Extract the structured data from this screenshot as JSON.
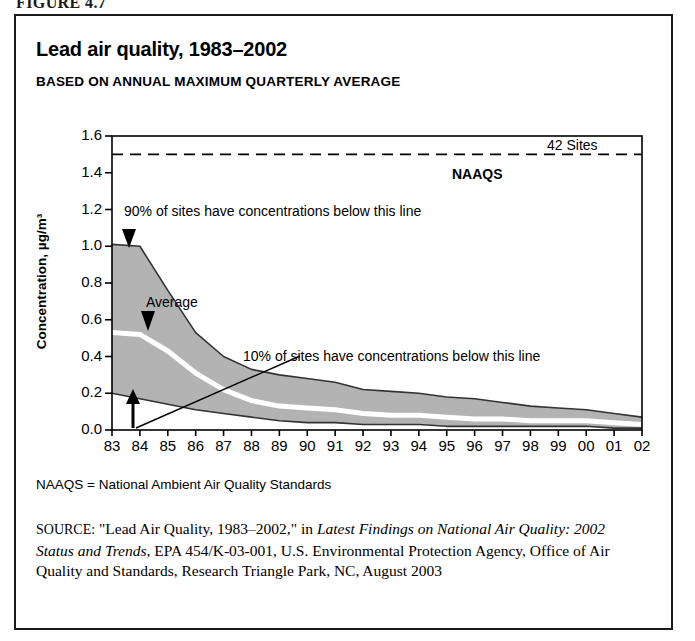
{
  "figure_label": "FIGURE 4.7",
  "title": "Lead air quality, 1983–2002",
  "subtitle": "BASED ON ANNUAL MAXIMUM QUARTERLY AVERAGE",
  "footnote": "NAAQS = National Ambient Air Quality Standards",
  "source": {
    "prefix": "SOURCE:",
    "quoted": "\"Lead Air Quality, 1983–2002,\"",
    "connector": "in",
    "italic_title": "Latest Findings on National Air Quality: 2002 Status and Trends,",
    "rest": "EPA 454/K-03-001, U.S. Environmental Protection Agency, Office of Air Quality and Standards, Research Triangle Park, NC, August 2003"
  },
  "colors": {
    "band_fill": "#b3b3b3",
    "band_line": "#333333",
    "average_line": "#ffffff",
    "axis": "#000000",
    "naaqs_line": "#000000"
  },
  "chart_data": {
    "type": "area",
    "title": "Lead air quality, 1983–2002",
    "subtitle": "BASED ON ANNUAL MAXIMUM QUARTERLY AVERAGE",
    "xlabel": "",
    "ylabel": "Concentration, µg/m³",
    "ylim": [
      0.0,
      1.6
    ],
    "ytick_labels": [
      "0.0",
      "0.2",
      "0.4",
      "0.6",
      "0.8",
      "1.0",
      "1.2",
      "1.4",
      "1.6"
    ],
    "ytick_values": [
      0.0,
      0.2,
      0.4,
      0.6,
      0.8,
      1.0,
      1.2,
      1.4,
      1.6
    ],
    "grid": false,
    "legend": "none",
    "x": [
      "83",
      "84",
      "85",
      "86",
      "87",
      "88",
      "89",
      "90",
      "91",
      "92",
      "93",
      "94",
      "95",
      "96",
      "97",
      "98",
      "99",
      "00",
      "01",
      "02"
    ],
    "x_full_years": [
      1983,
      1984,
      1985,
      1986,
      1987,
      1988,
      1989,
      1990,
      1991,
      1992,
      1993,
      1994,
      1995,
      1996,
      1997,
      1998,
      1999,
      2000,
      2001,
      2002
    ],
    "series": [
      {
        "name": "90% of sites have concentrations below this line",
        "role": "upper_band",
        "values": [
          1.01,
          1.0,
          0.76,
          0.53,
          0.4,
          0.33,
          0.3,
          0.28,
          0.26,
          0.22,
          0.21,
          0.2,
          0.18,
          0.17,
          0.15,
          0.13,
          0.12,
          0.11,
          0.09,
          0.07
        ]
      },
      {
        "name": "Average",
        "role": "mean_line",
        "values": [
          0.53,
          0.52,
          0.43,
          0.31,
          0.22,
          0.16,
          0.13,
          0.12,
          0.11,
          0.09,
          0.08,
          0.08,
          0.07,
          0.06,
          0.06,
          0.05,
          0.05,
          0.05,
          0.04,
          0.03
        ]
      },
      {
        "name": "10% of sites have concentrations below this line",
        "role": "lower_band",
        "values": [
          0.2,
          0.17,
          0.14,
          0.11,
          0.09,
          0.07,
          0.05,
          0.04,
          0.04,
          0.03,
          0.03,
          0.03,
          0.02,
          0.02,
          0.02,
          0.02,
          0.02,
          0.02,
          0.01,
          0.01
        ]
      }
    ],
    "reference_line": {
      "label": "NAAQS",
      "value": 1.5,
      "style": "dashed"
    },
    "annotations": [
      {
        "id": "sites-count",
        "text": "42 Sites"
      },
      {
        "id": "naaqs",
        "text": "NAAQS"
      },
      {
        "id": "p90",
        "text": "90% of sites have concentrations below this line"
      },
      {
        "id": "average",
        "text": "Average"
      },
      {
        "id": "p10",
        "text": "10% of sites have concentrations below this line"
      }
    ]
  }
}
